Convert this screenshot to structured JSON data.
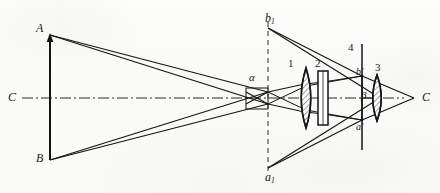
{
  "figure": {
    "kind": "optical-ray-diagram",
    "width": 440,
    "height": 193,
    "background_color": "#fcfcfb",
    "ink_color": "#1b1b1b"
  },
  "labels": {
    "object_top": "A",
    "object_bottom": "B",
    "axis_left": "C",
    "axis_right": "C",
    "intermediate_top": "b",
    "intermediate_top_sub": "1",
    "intermediate_bottom": "a",
    "intermediate_bottom_sub": "1",
    "angle_alpha": "α",
    "angle_beta": "β",
    "image_top": "b",
    "image_top_prime": "′",
    "image_bottom": "a",
    "image_bottom_prime": "′",
    "element_1": "1",
    "element_2": "2",
    "element_3": "3",
    "element_4": "4"
  },
  "elements": [
    {
      "id": "1",
      "name": "biconvex-lens-1",
      "type": "lens",
      "x": 306,
      "cy": 98,
      "half_height": 30
    },
    {
      "id": "2",
      "name": "plane-parallel-plate-2",
      "type": "plate",
      "x": 323,
      "cy": 98,
      "half_height": 27
    },
    {
      "id": "3",
      "name": "biconvex-lens-3",
      "type": "lens",
      "x": 377,
      "cy": 98,
      "half_height": 23
    },
    {
      "id": "4",
      "name": "image-plane-4",
      "type": "screen-line",
      "x": 362,
      "cy": 98,
      "half_height": 54
    }
  ],
  "points": {
    "object_plane_x": 50,
    "object_top_y": 35,
    "object_bottom_y": 160,
    "axis_y": 98,
    "stop_x": 268,
    "dashed_plane_x": 268,
    "dashed_top_y": 22,
    "dashed_bottom_y": 174,
    "b1_y": 28,
    "a1_y": 168,
    "image_plane_x": 362,
    "image_top_y": 76,
    "image_bottom_y": 120,
    "focus_x": 414
  }
}
